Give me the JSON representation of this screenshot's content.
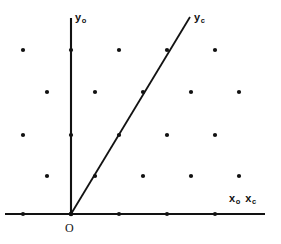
{
  "figure": {
    "background_color": "#ffffff",
    "ink_color": "#121212",
    "width": 281,
    "height": 244
  },
  "labels": {
    "y_original": {
      "base": "y",
      "sub": "o"
    },
    "y_transformed": {
      "base": "y",
      "sub": "c"
    },
    "x_original": {
      "base": "x",
      "sub": "o"
    },
    "x_transformed": {
      "base": "x",
      "sub": "c"
    },
    "origin": "O"
  },
  "chart_data": {
    "type": "scatter",
    "xlabel": "x_o  x_c",
    "ylabel": "y_o",
    "grid": false,
    "legend": null,
    "axis_style": "arrowless solid rules",
    "xlim": [
      5,
      265
    ],
    "ylim": [
      17,
      214
    ],
    "note": "Centered (staggered) two-dimensional lattice of points; rows alternate by a half period of 24 px. Pixel coordinates use screen convention with y increasing downward.",
    "lattice": {
      "column_spacing_px": 48,
      "row_spacing_px": 42,
      "row_offset_px": 24,
      "row_y_values": [
        50,
        92,
        135,
        176,
        214
      ],
      "rows": [
        {
          "y": 50,
          "x_values": [
            23,
            71,
            119,
            167,
            215
          ]
        },
        {
          "y": 92,
          "x_values": [
            47,
            95,
            143,
            191,
            239
          ]
        },
        {
          "y": 135,
          "x_values": [
            23,
            71,
            119,
            167,
            215
          ]
        },
        {
          "y": 176,
          "x_values": [
            47,
            95,
            143,
            191,
            239
          ]
        },
        {
          "y": 214,
          "x_values": [
            23,
            71,
            119,
            167,
            215
          ]
        }
      ]
    },
    "points": [
      {
        "x": 23,
        "y": 50
      },
      {
        "x": 71,
        "y": 50
      },
      {
        "x": 119,
        "y": 50
      },
      {
        "x": 167,
        "y": 50
      },
      {
        "x": 215,
        "y": 50
      },
      {
        "x": 47,
        "y": 92
      },
      {
        "x": 95,
        "y": 92
      },
      {
        "x": 143,
        "y": 92
      },
      {
        "x": 191,
        "y": 92
      },
      {
        "x": 239,
        "y": 92
      },
      {
        "x": 23,
        "y": 135
      },
      {
        "x": 71,
        "y": 135
      },
      {
        "x": 119,
        "y": 135
      },
      {
        "x": 167,
        "y": 135
      },
      {
        "x": 215,
        "y": 135
      },
      {
        "x": 47,
        "y": 176
      },
      {
        "x": 95,
        "y": 176
      },
      {
        "x": 143,
        "y": 176
      },
      {
        "x": 191,
        "y": 176
      },
      {
        "x": 239,
        "y": 176
      },
      {
        "x": 23,
        "y": 214
      },
      {
        "x": 71,
        "y": 214
      },
      {
        "x": 119,
        "y": 214
      },
      {
        "x": 167,
        "y": 214
      },
      {
        "x": 215,
        "y": 214
      }
    ],
    "point_radius_px": 2.1,
    "axes": [
      {
        "name": "x-axis",
        "label": "x_o  x_c",
        "x1": 5,
        "y1": 214,
        "x2": 265,
        "y2": 214,
        "shared_by": [
          "x_o",
          "x_c"
        ]
      },
      {
        "name": "y-axis-original",
        "label": "y_o",
        "x1": 71,
        "y1": 18,
        "x2": 71,
        "y2": 214
      }
    ],
    "lines": [
      {
        "name": "y-axis-transformed",
        "label": "y_c",
        "x1": 71,
        "y1": 214,
        "x2": 190,
        "y2": 17,
        "passes_through_lattice_points": [
          {
            "x": 95,
            "y": 176
          },
          {
            "x": 119,
            "y": 135
          },
          {
            "x": 143,
            "y": 92
          },
          {
            "x": 167,
            "y": 50
          }
        ],
        "slope_description": "rises 1 row per half-period shift in x (2:1 lattice direction)"
      }
    ],
    "origin": {
      "label": "O",
      "x": 71,
      "y": 214
    }
  }
}
